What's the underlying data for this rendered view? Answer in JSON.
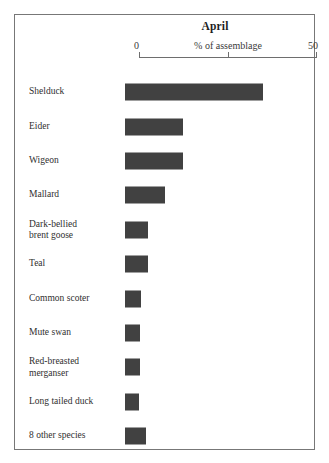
{
  "chart_data": {
    "type": "bar",
    "orientation": "horizontal",
    "title": "April",
    "xlabel": "% of assemblage",
    "ylabel": "",
    "xlim": [
      0,
      50
    ],
    "xticks": [
      0,
      25,
      50
    ],
    "xtick_labels": [
      "0",
      "",
      "50"
    ],
    "grid": false,
    "legend": false,
    "bar_color": "#414141",
    "categories": [
      "Shelduck",
      "Eider",
      "Wigeon",
      "Mallard",
      "Dark-bellied brent goose",
      "Teal",
      "Common scoter",
      "Mute swan",
      "Red-breasted merganser",
      "Long tailed duck",
      "8 other species"
    ],
    "values": [
      38.8,
      16.3,
      16.3,
      11.2,
      6.5,
      6.5,
      4.5,
      4.2,
      4.2,
      4.0,
      6.0
    ]
  },
  "axis": {
    "min_label": "0",
    "max_label": "50",
    "caption": "% of assemblage"
  },
  "rows": [
    {
      "label_line1": "Shelduck",
      "label_line2": "",
      "value": 38.8
    },
    {
      "label_line1": "Eider",
      "label_line2": "",
      "value": 16.3
    },
    {
      "label_line1": "Wigeon",
      "label_line2": "",
      "value": 16.3
    },
    {
      "label_line1": "Mallard",
      "label_line2": "",
      "value": 11.2
    },
    {
      "label_line1": "Dark-bellied",
      "label_line2": "brent goose",
      "value": 6.5
    },
    {
      "label_line1": "Teal",
      "label_line2": "",
      "value": 6.5
    },
    {
      "label_line1": "Common scoter",
      "label_line2": "",
      "value": 4.5
    },
    {
      "label_line1": "Mute swan",
      "label_line2": "",
      "value": 4.2
    },
    {
      "label_line1": "Red-breasted",
      "label_line2": "merganser",
      "value": 4.2
    },
    {
      "label_line1": "Long tailed duck",
      "label_line2": "",
      "value": 4.0
    },
    {
      "label_line1": "8 other species",
      "label_line2": "",
      "value": 6.0
    }
  ]
}
